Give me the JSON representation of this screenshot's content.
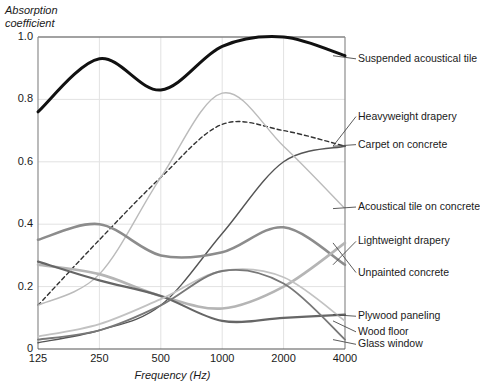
{
  "chart_data": {
    "type": "line",
    "title": "",
    "xlabel": "Frequency (Hz)",
    "ylabel": "Absorption\ncoefficient",
    "ylabel_line1": "Absorption",
    "ylabel_line2": "coefficient",
    "x_tick_labels": [
      "125",
      "250",
      "500",
      "1000",
      "2000",
      "4000"
    ],
    "x_tick_values": [
      125,
      250,
      500,
      1000,
      2000,
      4000
    ],
    "x_scale": "log2",
    "y_tick_labels": [
      "0",
      "0.2",
      "0.4",
      "0.6",
      "0.8",
      "1.0"
    ],
    "y_tick_values": [
      0,
      0.2,
      0.4,
      0.6,
      0.8,
      1.0
    ],
    "ylim": [
      0,
      1.0
    ],
    "grid": true,
    "legend_position": "right-inline-labels",
    "categories": [
      "125",
      "250",
      "500",
      "1000",
      "2000",
      "4000"
    ],
    "series": [
      {
        "name": "Suspended acoustical tile",
        "color": "#111111",
        "width": 3.0,
        "dash": "none",
        "values": [
          0.76,
          0.93,
          0.83,
          0.97,
          1.0,
          0.94
        ],
        "label_y": 0.93
      },
      {
        "name": "Heavyweight drapery",
        "color": "#333333",
        "width": 1.4,
        "dash": "dashed",
        "values": [
          0.14,
          0.35,
          0.55,
          0.72,
          0.7,
          0.65
        ],
        "label_y": 0.745
      },
      {
        "name": "Carpet on concrete",
        "color": "#555555",
        "width": 1.4,
        "dash": "none",
        "values": [
          0.02,
          0.06,
          0.14,
          0.37,
          0.6,
          0.65
        ],
        "label_y": 0.655
      },
      {
        "name": "Acoustical tile on concrete",
        "color": "#bbbbbb",
        "width": 1.4,
        "dash": "none",
        "values": [
          0.14,
          0.24,
          0.55,
          0.82,
          0.65,
          0.45
        ],
        "label_y": 0.455
      },
      {
        "name": "Lightweight drapery",
        "color": "#8c8c8c",
        "width": 2.6,
        "dash": "none",
        "values": [
          0.35,
          0.4,
          0.3,
          0.31,
          0.39,
          0.27
        ],
        "label_y": 0.345
      },
      {
        "name": "Unpainted concrete",
        "color": "#b5b5b5",
        "width": 2.6,
        "dash": "none",
        "values": [
          0.27,
          0.24,
          0.17,
          0.13,
          0.2,
          0.34
        ],
        "label_y": 0.245
      },
      {
        "name": "Plywood paneling",
        "color": "#666666",
        "width": 2.2,
        "dash": "none",
        "values": [
          0.28,
          0.22,
          0.17,
          0.09,
          0.1,
          0.11
        ],
        "label_y": 0.105
      },
      {
        "name": "Wood floor",
        "color": "#c2c2c2",
        "width": 1.8,
        "dash": "none",
        "values": [
          0.04,
          0.08,
          0.16,
          0.25,
          0.23,
          0.09
        ],
        "label_y": 0.055
      },
      {
        "name": "Glass window",
        "color": "#787878",
        "width": 1.8,
        "dash": "none",
        "values": [
          0.03,
          0.06,
          0.14,
          0.25,
          0.21,
          0.03
        ],
        "label_y": 0.015
      }
    ]
  }
}
